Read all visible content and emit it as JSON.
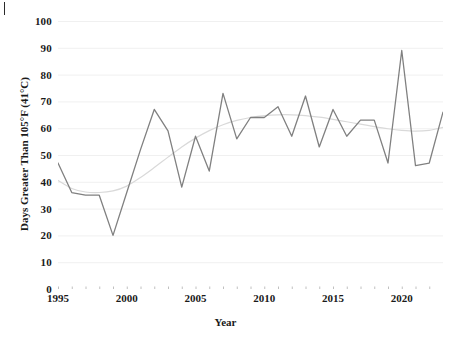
{
  "chart_data": {
    "type": "line",
    "title": "",
    "xlabel": "Year",
    "ylabel": "Days Greater Than 105°F (41°C)",
    "xlim": [
      1995,
      2023
    ],
    "ylim": [
      0,
      100
    ],
    "grid": true,
    "grid_axis": "y",
    "legend": "none",
    "ytick_labels": [
      "0",
      "10",
      "20",
      "30",
      "40",
      "50",
      "60",
      "70",
      "80",
      "90",
      "100"
    ],
    "ytick_values": [
      0,
      10,
      20,
      30,
      40,
      50,
      60,
      70,
      80,
      90,
      100
    ],
    "xtick_labels": [
      "1995",
      "2000",
      "2005",
      "2010",
      "2015",
      "2020"
    ],
    "xtick_values": [
      1995,
      2000,
      2005,
      2010,
      2015,
      2020
    ],
    "x": [
      1995,
      1996,
      1997,
      1998,
      1999,
      2000,
      2001,
      2002,
      2003,
      2004,
      2005,
      2006,
      2007,
      2008,
      2009,
      2010,
      2011,
      2012,
      2013,
      2014,
      2015,
      2016,
      2017,
      2018,
      2019,
      2020,
      2021,
      2022,
      2023
    ],
    "series": [
      {
        "name": "Days Greater Than 105°F (41°C)",
        "kind": "line",
        "color": "#808080",
        "linewidth": 1.3,
        "values": [
          47,
          36,
          35,
          35,
          20,
          36,
          52,
          67,
          59,
          38,
          57,
          44,
          73,
          56,
          64,
          64,
          68,
          57,
          72,
          53,
          67,
          57,
          63,
          63,
          47,
          89,
          46,
          47,
          66
        ]
      },
      {
        "name": "Polynomial trendline",
        "kind": "trendline",
        "color": "#d9d9d9",
        "linewidth": 1.2,
        "values": [
          40.5,
          37.5,
          36.2,
          36.0,
          36.6,
          38.4,
          41.6,
          45.3,
          49.2,
          53.0,
          56.3,
          59.1,
          61.3,
          62.9,
          64.0,
          64.7,
          65.0,
          65.0,
          64.7,
          64.1,
          63.3,
          62.4,
          61.5,
          60.6,
          59.8,
          59.2,
          58.9,
          59.2,
          60.3
        ]
      }
    ]
  },
  "axes": {
    "y_title": "Days Greater Than 105°F (41°C)",
    "x_title": "Year"
  }
}
